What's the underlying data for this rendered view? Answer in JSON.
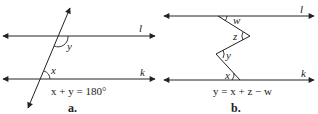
{
  "panels": [
    {
      "caption": "a.",
      "line_top_label": "l",
      "line_bottom_label": "k",
      "angle_labels": {
        "upper": "y",
        "lower": "x"
      },
      "equation": "x + y = 180°"
    },
    {
      "caption": "b.",
      "line_top_label": "l",
      "line_bottom_label": "k",
      "angle_labels": {
        "w": "w",
        "z": "z",
        "y": "y",
        "x": "x"
      },
      "equation": "y = x + z − w"
    }
  ],
  "colors": {
    "stroke": "#222222",
    "background": "#ffffff"
  }
}
